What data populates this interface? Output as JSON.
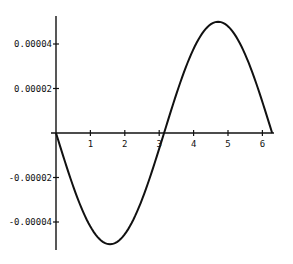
{
  "chart_data": {
    "type": "line",
    "title": "",
    "xlabel": "",
    "ylabel": "",
    "function": "-0.00005*sin(x)",
    "xlim": [
      0,
      6.283
    ],
    "ylim": [
      -5e-05,
      5e-05
    ],
    "grid": false,
    "legend": null,
    "x_ticks": [
      1,
      2,
      3,
      4,
      5,
      6
    ],
    "x_tick_labels": [
      "1",
      "2",
      "3",
      "4",
      "5",
      "6"
    ],
    "y_ticks": [
      4e-05,
      2e-05,
      -2e-05,
      -4e-05
    ],
    "y_tick_labels": [
      "0.00004",
      "0.00002",
      "-0.00002",
      "-0.00004"
    ],
    "series": [
      {
        "name": "curve",
        "x": [
          0,
          0.5,
          1,
          1.5708,
          2,
          2.5,
          3,
          3.1416,
          3.5,
          4,
          4.7124,
          5,
          5.5,
          6,
          6.2832
        ],
        "values": [
          0,
          -2.4e-05,
          -4.2e-05,
          -5e-05,
          -4.5e-05,
          -3e-05,
          -7e-06,
          0,
          1.8e-05,
          3.8e-05,
          5e-05,
          4.8e-05,
          3.5e-05,
          1.4e-05,
          0
        ]
      }
    ]
  }
}
